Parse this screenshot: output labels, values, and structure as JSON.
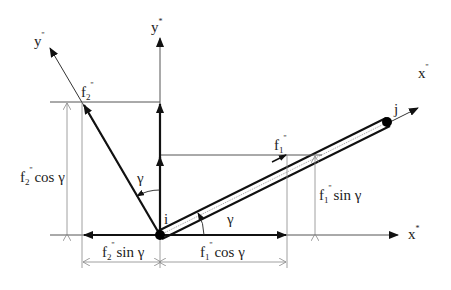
{
  "diagram": {
    "type": "force-decomposition",
    "nodes": {
      "start": {
        "label": "i"
      },
      "end": {
        "label": "j"
      }
    },
    "axes": {
      "global_x": {
        "label": "x",
        "mark": "*"
      },
      "global_y": {
        "label": "y",
        "mark": "*"
      },
      "local_x": {
        "label": "x",
        "mark": "''"
      },
      "local_y": {
        "label": "y",
        "mark": "''"
      }
    },
    "forces": {
      "f1": {
        "label": "f",
        "sub": "1",
        "mark": "''"
      },
      "f2": {
        "label": "f",
        "sub": "2",
        "mark": "''"
      }
    },
    "angles": {
      "gamma_1": {
        "label": "γ"
      },
      "gamma_2": {
        "label": "γ"
      }
    },
    "dimensions": {
      "f2_cos": {
        "f": "f",
        "sub": "2",
        "mark": "''",
        "fn": "cos γ"
      },
      "f2_sin": {
        "f": "f",
        "sub": "2",
        "mark": "''",
        "fn": "sin γ"
      },
      "f1_cos": {
        "f": "f",
        "sub": "1",
        "mark": "''",
        "fn": "cos γ"
      },
      "f1_sin": {
        "f": "f",
        "sub": "1",
        "mark": "''",
        "fn": "sin γ"
      }
    },
    "colors": {
      "line": "#1a1a1a",
      "thin": "#555555",
      "dim": "#8a8a8a"
    }
  }
}
